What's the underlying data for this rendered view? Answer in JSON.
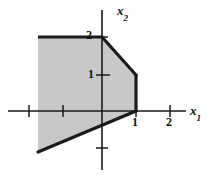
{
  "figure": {
    "kind": "feasible-region-plot",
    "background": "#ffffff",
    "line_color": "#1a1a1a",
    "shade_fill": "#c8c8c8",
    "shade_edge": "#1a1a1a",
    "width": 210,
    "height": 177
  },
  "axes": {
    "x_label": "x",
    "x_label_sub": "1",
    "y_label": "x",
    "y_label_sub": "2",
    "origin_px": {
      "x": 102,
      "y": 111
    },
    "unit_px": {
      "x": 34.5,
      "y": 37
    },
    "x_range": [
      -3.0,
      2.8
    ],
    "y_range": [
      -1.8,
      2.9
    ],
    "x_ticks": [
      -2,
      -1,
      1,
      2
    ],
    "y_ticks": [
      -1,
      1,
      2
    ],
    "x_tick_labels": [
      {
        "value": 1,
        "text": "1"
      },
      {
        "value": 2,
        "text": "2"
      }
    ],
    "y_tick_labels": [
      {
        "value": 1,
        "text": "1"
      },
      {
        "value": 2,
        "text": "2"
      }
    ],
    "grid": false
  },
  "chart_data": {
    "type": "area",
    "title": "",
    "xlabel": "x1",
    "ylabel": "x2",
    "xlim": [
      -3.0,
      2.8
    ],
    "ylim": [
      -1.8,
      2.9
    ],
    "grid": false,
    "legend": "none",
    "regions": [
      {
        "name": "feasible-region",
        "unbounded": true,
        "fill": "#c8c8c8",
        "edge": "#1a1a1a",
        "vertices_data": [
          [
            -1.86,
            2.0
          ],
          [
            0.0,
            2.0
          ],
          [
            1.0,
            1.0
          ],
          [
            1.0,
            0.0
          ],
          [
            -1.86,
            -1.11
          ]
        ],
        "vertices_px": [
          [
            38,
            37
          ],
          [
            102,
            37
          ],
          [
            136,
            75
          ],
          [
            136,
            111
          ],
          [
            38,
            152
          ]
        ],
        "drawn_edges_px": [
          [
            [
              38,
              37
            ],
            [
              102,
              37
            ]
          ],
          [
            [
              102,
              37
            ],
            [
              136,
              75
            ]
          ],
          [
            [
              136,
              75
            ],
            [
              136,
              111
            ]
          ],
          [
            [
              136,
              111
            ],
            [
              38,
              152
            ]
          ]
        ],
        "clipped_edge_px": [
          [
            38,
            37
          ],
          [
            38,
            152
          ]
        ]
      }
    ],
    "annotations": [
      {
        "text": "2",
        "at_px": [
          86,
          29
        ],
        "role": "y-tick-label"
      },
      {
        "text": "1",
        "at_px": [
          88,
          68
        ],
        "role": "y-tick-label"
      },
      {
        "text": "1",
        "at_px": [
          132,
          116
        ],
        "role": "x-tick-label"
      },
      {
        "text": "2",
        "at_px": [
          166,
          116
        ],
        "role": "x-tick-label"
      }
    ]
  }
}
